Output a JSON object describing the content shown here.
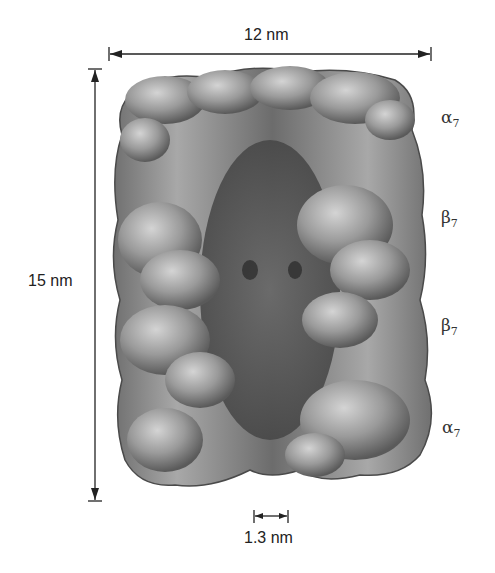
{
  "figure": {
    "dimensions": {
      "width_label": "12 nm",
      "height_label": "15 nm",
      "pore_label": "1.3 nm"
    },
    "rings": [
      {
        "symbol": "α",
        "subscript": "7"
      },
      {
        "symbol": "β",
        "subscript": "7"
      },
      {
        "symbol": "β",
        "subscript": "7"
      },
      {
        "symbol": "α",
        "subscript": "7"
      }
    ],
    "colors": {
      "background": "#ffffff",
      "line": "#222222",
      "surface_light": "#bdbdbd",
      "surface_mid": "#8c8c8c",
      "surface_dark": "#505050"
    }
  }
}
